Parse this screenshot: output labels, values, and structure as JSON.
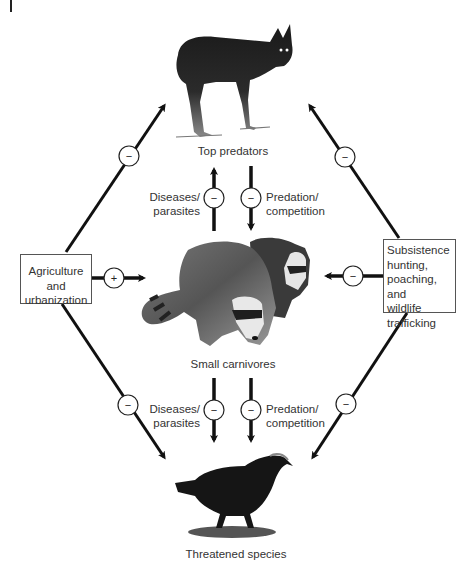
{
  "nodes": {
    "top_predators": {
      "label": "Top predators",
      "icon": "coyote-silhouette"
    },
    "small_carnivores": {
      "label": "Small carnivores",
      "icon": "raccoons-silhouette"
    },
    "threatened_species": {
      "label": "Threatened species",
      "icon": "crow-silhouette"
    },
    "agriculture": {
      "lines": [
        "Agriculture and",
        "urbanization"
      ]
    },
    "hunting": {
      "lines": [
        "Subsistence",
        "hunting,",
        "poaching, and",
        "wildlife",
        "trafficking"
      ]
    }
  },
  "edges": {
    "upper_left": {
      "lines": [
        "Diseases/",
        "parasites"
      ],
      "sign": "−"
    },
    "upper_right": {
      "lines": [
        "Predation/",
        "competition"
      ],
      "sign": "−"
    },
    "lower_left": {
      "lines": [
        "Diseases/",
        "parasites"
      ],
      "sign": "−"
    },
    "lower_right": {
      "lines": [
        "Predation/",
        "competition"
      ],
      "sign": "−"
    },
    "agri_to_small": {
      "sign": "+"
    },
    "agri_to_top": {
      "sign": "−"
    },
    "agri_to_threatened": {
      "sign": "−"
    },
    "hunting_to_small": {
      "sign": "−"
    },
    "hunting_to_top": {
      "sign": "−"
    },
    "hunting_to_threatened": {
      "sign": "−"
    }
  },
  "colors": {
    "line": "#111111",
    "text": "#333333",
    "circle_fill": "#ffffff"
  }
}
